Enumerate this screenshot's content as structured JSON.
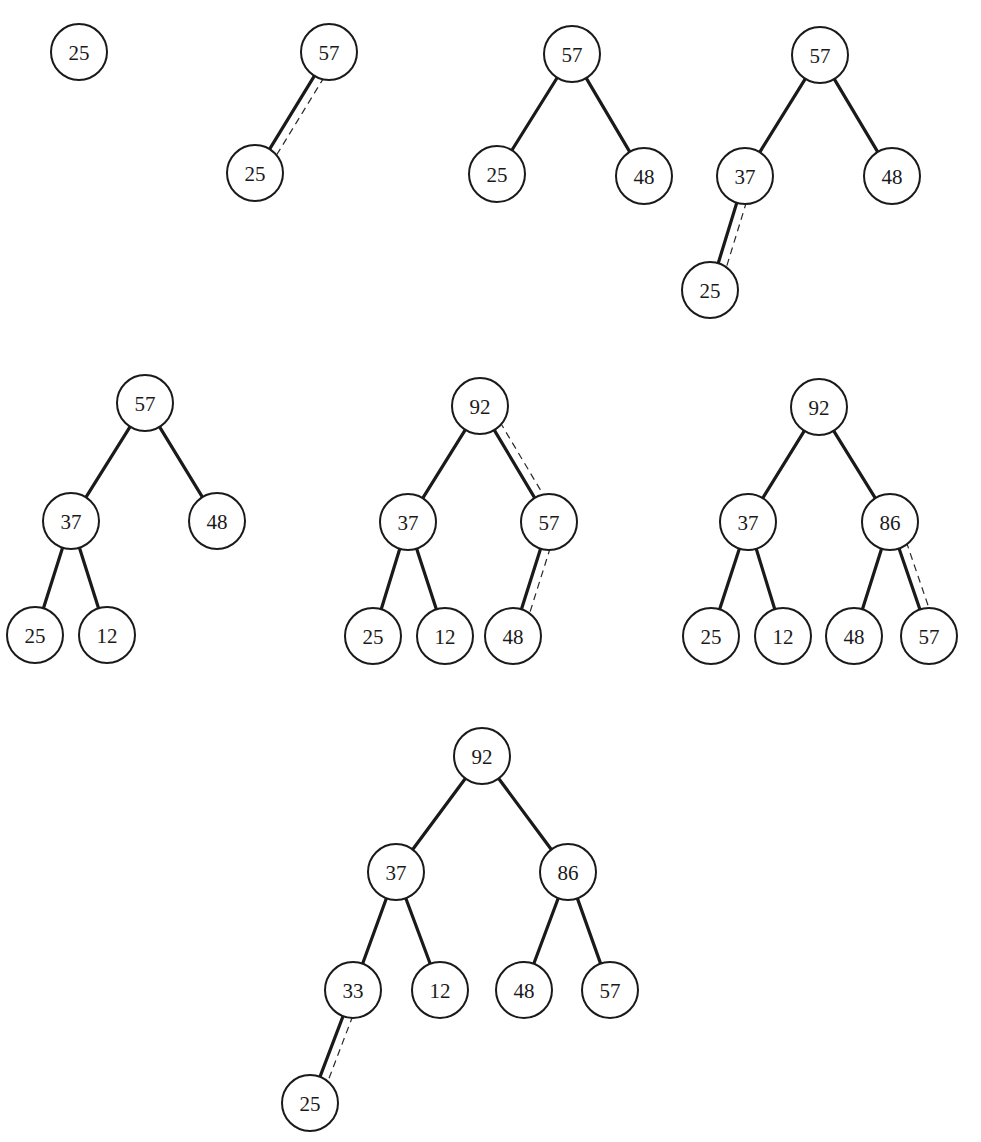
{
  "diagram": {
    "title": "",
    "node_radius": 28,
    "colors": {
      "stroke": "#1a1a1a",
      "fill": "#ffffff",
      "background": "#ffffff"
    },
    "steps": [
      {
        "id": "step-1",
        "nodes": [
          {
            "id": "a",
            "label": "25",
            "x": 79,
            "y": 52
          }
        ],
        "edges": []
      },
      {
        "id": "step-2",
        "nodes": [
          {
            "id": "a",
            "label": "57",
            "x": 329,
            "y": 52
          },
          {
            "id": "b",
            "label": "25",
            "x": 255,
            "y": 173
          }
        ],
        "edges": [
          {
            "from": "a",
            "to": "b",
            "swap": true
          }
        ]
      },
      {
        "id": "step-3",
        "nodes": [
          {
            "id": "a",
            "label": "57",
            "x": 572,
            "y": 54
          },
          {
            "id": "b",
            "label": "25",
            "x": 497,
            "y": 174
          },
          {
            "id": "c",
            "label": "48",
            "x": 644,
            "y": 176
          }
        ],
        "edges": [
          {
            "from": "a",
            "to": "b",
            "swap": false
          },
          {
            "from": "a",
            "to": "c",
            "swap": false
          }
        ]
      },
      {
        "id": "step-4",
        "nodes": [
          {
            "id": "a",
            "label": "57",
            "x": 820,
            "y": 55
          },
          {
            "id": "b",
            "label": "37",
            "x": 745,
            "y": 176
          },
          {
            "id": "c",
            "label": "48",
            "x": 892,
            "y": 176
          },
          {
            "id": "d",
            "label": "25",
            "x": 710,
            "y": 290
          }
        ],
        "edges": [
          {
            "from": "a",
            "to": "b",
            "swap": false
          },
          {
            "from": "a",
            "to": "c",
            "swap": false
          },
          {
            "from": "b",
            "to": "d",
            "swap": true
          }
        ]
      },
      {
        "id": "step-5",
        "nodes": [
          {
            "id": "a",
            "label": "57",
            "x": 145,
            "y": 403
          },
          {
            "id": "b",
            "label": "37",
            "x": 71,
            "y": 521
          },
          {
            "id": "c",
            "label": "48",
            "x": 217,
            "y": 521
          },
          {
            "id": "d",
            "label": "25",
            "x": 35,
            "y": 635
          },
          {
            "id": "e",
            "label": "12",
            "x": 107,
            "y": 635
          }
        ],
        "edges": [
          {
            "from": "a",
            "to": "b",
            "swap": false
          },
          {
            "from": "a",
            "to": "c",
            "swap": false
          },
          {
            "from": "b",
            "to": "d",
            "swap": false
          },
          {
            "from": "b",
            "to": "e",
            "swap": false
          }
        ]
      },
      {
        "id": "step-6",
        "nodes": [
          {
            "id": "a",
            "label": "92",
            "x": 480,
            "y": 406
          },
          {
            "id": "b",
            "label": "37",
            "x": 408,
            "y": 522
          },
          {
            "id": "c",
            "label": "57",
            "x": 549,
            "y": 522
          },
          {
            "id": "d",
            "label": "25",
            "x": 373,
            "y": 636
          },
          {
            "id": "e",
            "label": "12",
            "x": 445,
            "y": 636
          },
          {
            "id": "f",
            "label": "48",
            "x": 513,
            "y": 636
          }
        ],
        "edges": [
          {
            "from": "a",
            "to": "b",
            "swap": false
          },
          {
            "from": "a",
            "to": "c",
            "swap": true
          },
          {
            "from": "b",
            "to": "d",
            "swap": false
          },
          {
            "from": "b",
            "to": "e",
            "swap": false
          },
          {
            "from": "c",
            "to": "f",
            "swap": true
          }
        ]
      },
      {
        "id": "step-7",
        "nodes": [
          {
            "id": "a",
            "label": "92",
            "x": 819,
            "y": 407
          },
          {
            "id": "b",
            "label": "37",
            "x": 748,
            "y": 522
          },
          {
            "id": "c",
            "label": "86",
            "x": 890,
            "y": 522
          },
          {
            "id": "d",
            "label": "25",
            "x": 711,
            "y": 636
          },
          {
            "id": "e",
            "label": "12",
            "x": 783,
            "y": 636
          },
          {
            "id": "f",
            "label": "48",
            "x": 854,
            "y": 636
          },
          {
            "id": "g",
            "label": "57",
            "x": 929,
            "y": 636
          }
        ],
        "edges": [
          {
            "from": "a",
            "to": "b",
            "swap": false
          },
          {
            "from": "a",
            "to": "c",
            "swap": false
          },
          {
            "from": "b",
            "to": "d",
            "swap": false
          },
          {
            "from": "b",
            "to": "e",
            "swap": false
          },
          {
            "from": "c",
            "to": "f",
            "swap": false
          },
          {
            "from": "c",
            "to": "g",
            "swap": true
          }
        ]
      },
      {
        "id": "step-8",
        "nodes": [
          {
            "id": "a",
            "label": "92",
            "x": 482,
            "y": 756
          },
          {
            "id": "b",
            "label": "37",
            "x": 396,
            "y": 872
          },
          {
            "id": "c",
            "label": "86",
            "x": 568,
            "y": 872
          },
          {
            "id": "d",
            "label": "33",
            "x": 353,
            "y": 990
          },
          {
            "id": "e",
            "label": "12",
            "x": 440,
            "y": 990
          },
          {
            "id": "f",
            "label": "48",
            "x": 524,
            "y": 990
          },
          {
            "id": "g",
            "label": "57",
            "x": 610,
            "y": 990
          },
          {
            "id": "h",
            "label": "25",
            "x": 310,
            "y": 1103
          }
        ],
        "edges": [
          {
            "from": "a",
            "to": "b",
            "swap": false
          },
          {
            "from": "a",
            "to": "c",
            "swap": false
          },
          {
            "from": "b",
            "to": "d",
            "swap": false
          },
          {
            "from": "b",
            "to": "e",
            "swap": false
          },
          {
            "from": "c",
            "to": "f",
            "swap": false
          },
          {
            "from": "c",
            "to": "g",
            "swap": false
          },
          {
            "from": "d",
            "to": "h",
            "swap": true
          }
        ]
      }
    ]
  }
}
